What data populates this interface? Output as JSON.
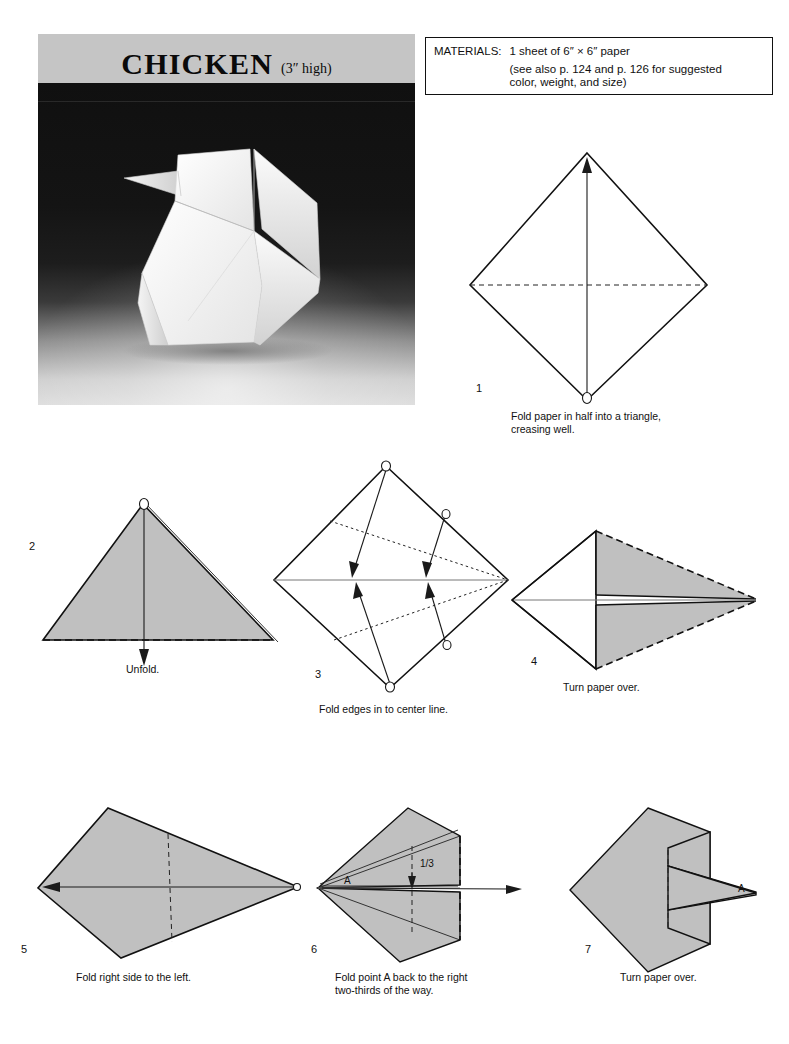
{
  "page": {
    "background_color": "#ffffff",
    "width": 789,
    "height": 1044
  },
  "header": {
    "title": "CHICKEN",
    "size_note": "(3″ high)",
    "band_color": "#c5c5c5"
  },
  "photo": {
    "alt_name": "origami-chicken-photo",
    "subject": "white paper chicken",
    "background_color": "#111111",
    "floor_color": "#dedede"
  },
  "materials": {
    "label": "MATERIALS:",
    "line1": "1 sheet of 6″ × 6″ paper",
    "line2": "(see also p. 124 and p. 126 for suggested",
    "line3": "color, weight, and size)"
  },
  "colors": {
    "paper_front": "#c0c0c0",
    "paper_back": "#ffffff",
    "ink": "#111111"
  },
  "steps": [
    {
      "number": "1",
      "caption": "Fold paper in half into a triangle,\ncreasing well.",
      "shape": "square-diamond",
      "fill": "#ffffff"
    },
    {
      "number": "2",
      "caption": "Unfold.",
      "shape": "triangle",
      "fill": "#c0c0c0"
    },
    {
      "number": "3",
      "caption": "Fold edges in to center line.",
      "shape": "square-diamond",
      "fill": "#ffffff"
    },
    {
      "number": "4",
      "caption": "Turn paper over.",
      "shape": "kite",
      "fill": "#c0c0c0"
    },
    {
      "number": "5",
      "caption": "Fold right side to the left.",
      "shape": "kite",
      "fill": "#c0c0c0"
    },
    {
      "number": "6",
      "caption": "Fold point A back to the right\ntwo-thirds of the way.",
      "shape": "folded-kite",
      "fill": "#c0c0c0",
      "labels": [
        {
          "text": "A",
          "role": "point-label"
        },
        {
          "text": "1/3",
          "role": "measurement-label"
        }
      ]
    },
    {
      "number": "7",
      "caption": "Turn paper over.",
      "shape": "chicken-blank",
      "fill": "#c0c0c0",
      "labels": [
        {
          "text": "A",
          "role": "point-label"
        }
      ]
    }
  ]
}
